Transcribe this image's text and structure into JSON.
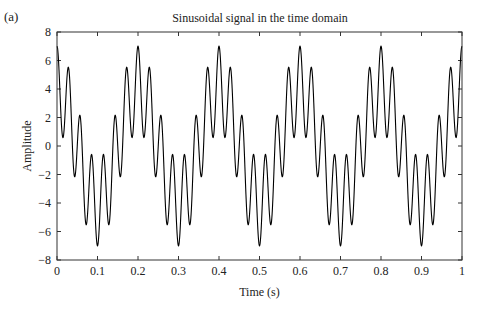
{
  "panel_label": "(a)",
  "chart_data": {
    "type": "line",
    "title": "Sinusoidal signal in the time domain",
    "xlabel": "Time (s)",
    "ylabel": "Amplitude",
    "xlim": [
      0,
      1
    ],
    "ylim": [
      -8,
      8
    ],
    "xticks": [
      0,
      0.1,
      0.2,
      0.3,
      0.4,
      0.5,
      0.6,
      0.7,
      0.8,
      0.9,
      1
    ],
    "xtick_labels": [
      "0",
      "0.1",
      "0.2",
      "0.3",
      "0.4",
      "0.5",
      "0.6",
      "0.7",
      "0.8",
      "0.9",
      "1"
    ],
    "yticks": [
      -8,
      -6,
      -4,
      -2,
      0,
      2,
      4,
      6,
      8
    ],
    "ytick_labels": [
      "−8",
      "−6",
      "−4",
      "−2",
      "0",
      "2",
      "4",
      "6",
      "8"
    ],
    "grid": false,
    "legend": null,
    "series": [
      {
        "name": "x(t)",
        "color": "#000000",
        "formula": "4*cos(2*pi*5*t) + 3*cos(2*pi*35*t)",
        "components": [
          {
            "amplitude": 4,
            "frequency_hz": 5
          },
          {
            "amplitude": 3,
            "frequency_hz": 35
          }
        ],
        "samples": 2000,
        "key_points": [
          {
            "t": 0.0,
            "y": 7
          },
          {
            "t": 0.1,
            "y": -7
          },
          {
            "t": 0.2,
            "y": 7
          },
          {
            "t": 0.3,
            "y": -7
          },
          {
            "t": 0.4,
            "y": 7
          },
          {
            "t": 0.5,
            "y": -7
          },
          {
            "t": 0.6,
            "y": 7
          },
          {
            "t": 0.7,
            "y": -7
          },
          {
            "t": 0.8,
            "y": 7
          },
          {
            "t": 0.9,
            "y": -7
          },
          {
            "t": 1.0,
            "y": 7
          }
        ]
      }
    ]
  }
}
